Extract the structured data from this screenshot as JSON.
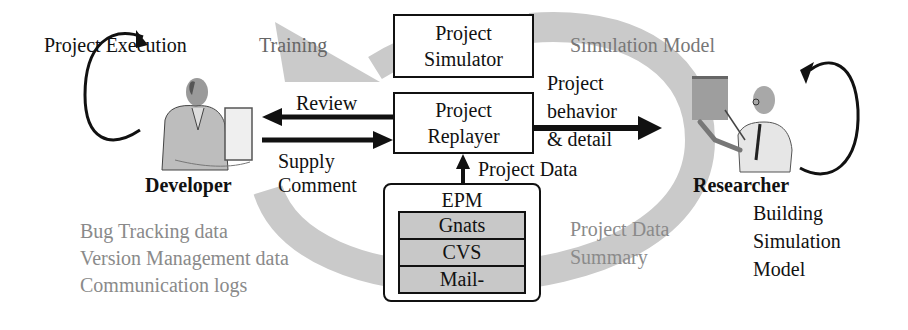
{
  "diagram": {
    "labels": {
      "project_execution": "Project Execution",
      "training": "Training",
      "simulation_model": "Simulation Model",
      "review": "Review",
      "supply": "Supply",
      "comment": "Comment",
      "project_behavior_1": "Project",
      "project_behavior_2": "behavior",
      "project_behavior_3": "& detail",
      "project_data": "Project Data",
      "developer": "Developer",
      "researcher": "Researcher",
      "building_1": "Building",
      "building_2": "Simulation",
      "building_3": "Model",
      "project_data_summary_1": "Project Data",
      "project_data_summary_2": "Summary",
      "dev_data_1": "Bug Tracking data",
      "dev_data_2": "Version Management data",
      "dev_data_3": "Communication logs"
    },
    "boxes": {
      "simulator_1": "Project",
      "simulator_2": "Simulator",
      "replayer_1": "Project",
      "replayer_2": "Replayer"
    },
    "epm": {
      "title": "EPM",
      "rows": [
        "Gnats",
        "CVS",
        "Mail-"
      ]
    },
    "icons": {
      "developer": "developer-at-computer-illustration",
      "researcher": "researcher-presenting-illustration"
    },
    "colors": {
      "arc": "#c9c9c9",
      "text": "#111111",
      "grey_text": "#8a8a8a",
      "db_fill": "#c8c8c8"
    }
  }
}
